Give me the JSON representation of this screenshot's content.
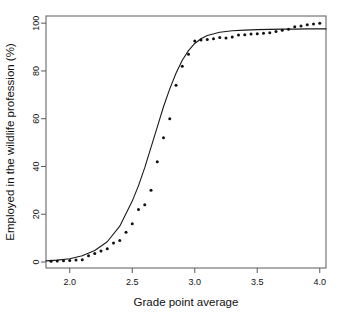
{
  "figure": {
    "background_color": "#ffffff",
    "plot_box": {
      "left": 46,
      "top": 16,
      "right": 326,
      "bottom": 268
    },
    "box_color": "#5a5a5a",
    "curve_color": "#1a1a1a",
    "point_color": "#111111"
  },
  "chart_data": {
    "type": "scatter",
    "title": "",
    "subtitle": "",
    "xlabel": "Grade point average",
    "ylabel": "Employed in the wildlife profession (%)",
    "xlim": [
      1.81,
      4.05
    ],
    "ylim": [
      -2.5,
      103
    ],
    "grid": false,
    "legend": "none",
    "xticks": [
      2.0,
      2.5,
      3.0,
      3.5,
      4.0
    ],
    "xtick_labels": [
      "2.0",
      "2.5",
      "3.0",
      "3.5",
      "4.0"
    ],
    "yticks": [
      0,
      20,
      40,
      60,
      80,
      100
    ],
    "ytick_labels": [
      "0",
      "20",
      "40",
      "60",
      "80",
      "100"
    ],
    "series": [
      {
        "name": "Observed proportion",
        "type": "scatter",
        "marker": "filled-circle",
        "x": [
          1.85,
          1.9,
          1.95,
          2.0,
          2.05,
          2.1,
          2.15,
          2.2,
          2.25,
          2.3,
          2.35,
          2.4,
          2.45,
          2.5,
          2.55,
          2.6,
          2.65,
          2.7,
          2.75,
          2.8,
          2.85,
          2.9,
          2.95,
          3.0,
          3.05,
          3.1,
          3.15,
          3.2,
          3.25,
          3.3,
          3.35,
          3.4,
          3.45,
          3.5,
          3.55,
          3.6,
          3.65,
          3.7,
          3.75,
          3.8,
          3.85,
          3.9,
          3.95,
          4.0
        ],
        "y": [
          0.3,
          0.4,
          0.5,
          0.6,
          0.8,
          1.0,
          2.6,
          3.6,
          4.6,
          5.6,
          8.0,
          9.0,
          12.5,
          16.0,
          22.0,
          24.0,
          30.0,
          42.0,
          52.0,
          60.0,
          74.0,
          82.0,
          87.0,
          92.5,
          93.0,
          93.2,
          93.5,
          94.0,
          93.8,
          94.2,
          95.0,
          95.2,
          95.5,
          95.6,
          95.8,
          96.0,
          96.5,
          97.0,
          97.5,
          98.5,
          98.8,
          99.3,
          99.6,
          100.0
        ]
      },
      {
        "name": "Fitted logistic curve",
        "type": "line",
        "model": "logistic",
        "asymptote": 97.8,
        "midpoint": 2.72,
        "slope": 6.4,
        "x": [
          1.81,
          1.9,
          2.0,
          2.1,
          2.2,
          2.3,
          2.4,
          2.5,
          2.55,
          2.6,
          2.65,
          2.7,
          2.75,
          2.8,
          2.85,
          2.9,
          2.95,
          3.0,
          3.05,
          3.1,
          3.2,
          3.3,
          3.4,
          3.5,
          3.6,
          3.7,
          3.8,
          3.9,
          4.0,
          4.05
        ],
        "y": [
          0.5,
          0.8,
          1.4,
          2.6,
          4.8,
          8.5,
          15.0,
          25.5,
          32.0,
          39.5,
          48.0,
          56.5,
          65.0,
          72.5,
          79.0,
          84.5,
          88.5,
          91.5,
          93.5,
          94.8,
          96.2,
          96.8,
          97.1,
          97.3,
          97.4,
          97.5,
          97.5,
          97.6,
          97.6,
          97.6
        ]
      }
    ]
  }
}
